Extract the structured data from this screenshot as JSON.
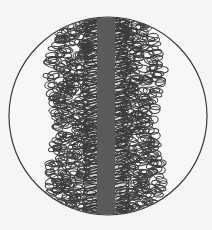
{
  "diagram": {
    "background": "#f5f5f5",
    "lens": {
      "cx": 108,
      "cy": 116,
      "r": 99,
      "fill": "#f7f7f7",
      "stroke": "#3a3a3a"
    },
    "core": {
      "x": 97,
      "width": 18,
      "color": "#5a5a5a"
    },
    "loops": {
      "stroke": "#3c3c3c",
      "fill": "#8a8a8a",
      "left_extent": 46,
      "right_extent": 164,
      "row_spacing": 7
    }
  }
}
